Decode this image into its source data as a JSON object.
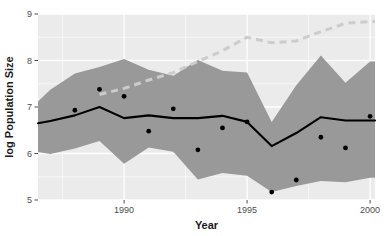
{
  "chart_data": {
    "type": "line",
    "title": "",
    "xlabel": "Year",
    "ylabel": "log Population Size",
    "xlim": [
      1986.5,
      2000.2
    ],
    "ylim": [
      5,
      9
    ],
    "xticks": [
      1990,
      1995,
      2000
    ],
    "xtick_labels": [
      "1990",
      "1995",
      "2000"
    ],
    "yticks": [
      5,
      6,
      7,
      8,
      9
    ],
    "ytick_labels": [
      "5",
      "6",
      "7",
      "8",
      "9"
    ],
    "grid": true,
    "legend": "none",
    "panel_background": "#ebebeb",
    "gridline_color": "#ffffff",
    "ribbon_color": "#999999",
    "solid_line_color": "#000000",
    "dashed_line_color": "#cccccc",
    "point_color": "#000000",
    "x": [
      1986.5,
      1987,
      1988,
      1989,
      1990,
      1991,
      1992,
      1993,
      1994,
      1995,
      1996,
      1997,
      1998,
      1999,
      2000,
      2000.2
    ],
    "series": [
      {
        "name": "median estimate",
        "style": "solid",
        "values": [
          6.65,
          6.7,
          6.82,
          7.0,
          6.76,
          6.82,
          6.76,
          6.76,
          6.81,
          6.68,
          6.16,
          6.44,
          6.78,
          6.71,
          6.71,
          6.71
        ]
      },
      {
        "name": "upper credible bound",
        "style": "ribbon-upper",
        "values": [
          7.12,
          7.37,
          7.72,
          7.86,
          8.03,
          7.8,
          7.67,
          8.01,
          7.78,
          7.74,
          6.68,
          7.47,
          8.11,
          7.52,
          7.98,
          7.98
        ]
      },
      {
        "name": "lower credible bound",
        "style": "ribbon-lower",
        "values": [
          6.03,
          5.99,
          6.11,
          6.27,
          5.78,
          6.13,
          6.04,
          5.44,
          5.58,
          5.52,
          5.17,
          5.3,
          5.41,
          5.38,
          5.48,
          5.48
        ]
      },
      {
        "name": "alternative trend",
        "style": "dashed",
        "values": [
          null,
          null,
          null,
          7.27,
          7.4,
          7.58,
          7.74,
          7.98,
          8.21,
          8.5,
          8.38,
          8.42,
          8.62,
          8.8,
          8.84,
          8.84
        ]
      }
    ],
    "points": {
      "name": "observed counts",
      "x": [
        1988,
        1989,
        1990,
        1991,
        1992,
        1993,
        1994,
        1995,
        1996,
        1997,
        1998,
        1999,
        2000
      ],
      "y": [
        6.93,
        7.38,
        7.23,
        6.48,
        6.96,
        6.08,
        6.55,
        6.68,
        5.17,
        5.43,
        6.35,
        6.12,
        6.8
      ]
    }
  },
  "axis": {
    "x_title": "Year",
    "y_title": "log Population Size"
  }
}
